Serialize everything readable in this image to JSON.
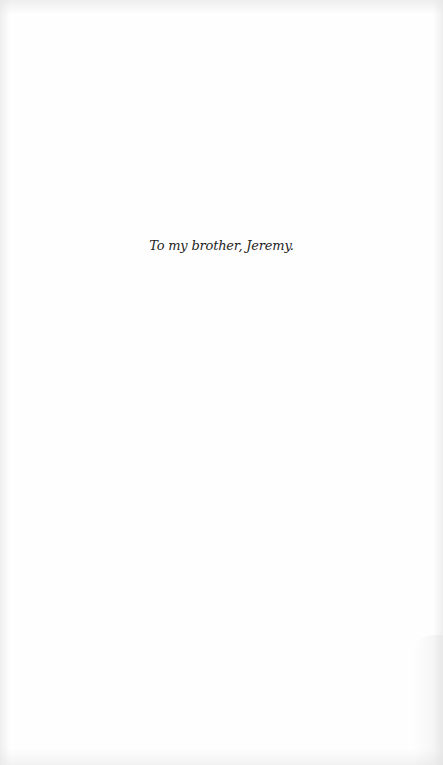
{
  "page": {
    "type": "dedication",
    "background_color": "#fefefe",
    "text_color": "#1e1e1e"
  },
  "dedication": {
    "text": "To my brother, Jeremy."
  }
}
